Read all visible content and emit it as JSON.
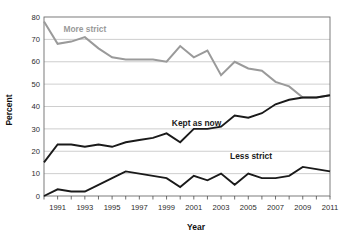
{
  "chart_data": {
    "type": "line",
    "title": "",
    "subtitle": "",
    "xlabel": "Year",
    "ylabel": "Percent",
    "xlim": [
      1990,
      2011
    ],
    "ylim": [
      0,
      80
    ],
    "grid": true,
    "legend_position": "inline-labels",
    "x_tick_labels": [
      "1991",
      "1993",
      "1995",
      "1997",
      "1999",
      "2001",
      "2003",
      "2005",
      "2007",
      "2009",
      "2011"
    ],
    "x_tick_values": [
      1991,
      1993,
      1995,
      1997,
      1999,
      2001,
      2003,
      2005,
      2007,
      2009,
      2011
    ],
    "x_minor_ticks": [
      1990,
      1991,
      1992,
      1993,
      1994,
      1995,
      1996,
      1997,
      1998,
      1999,
      2000,
      2001,
      2002,
      2003,
      2004,
      2005,
      2006,
      2007,
      2008,
      2009,
      2010,
      2011
    ],
    "y_tick_labels": [
      "0",
      "10",
      "20",
      "30",
      "40",
      "50",
      "60",
      "70",
      "80"
    ],
    "y_tick_values": [
      0,
      10,
      20,
      30,
      40,
      50,
      60,
      70,
      80
    ],
    "x": [
      1990,
      1991,
      1992,
      1993,
      1994,
      1995,
      1996,
      1997,
      1998,
      1999,
      2000,
      2001,
      2002,
      2003,
      2004,
      2005,
      2006,
      2007,
      2008,
      2009,
      2010,
      2011
    ],
    "series": [
      {
        "name": "More strict",
        "color": "#9a9a9a",
        "label_x": 1993.0,
        "label_y": 73.5,
        "values": [
          78,
          68,
          69,
          71,
          66,
          62,
          61,
          61,
          61,
          60,
          67,
          62,
          65,
          54,
          60,
          57,
          56,
          51,
          49,
          44,
          44,
          45
        ]
      },
      {
        "name": "Kept as now",
        "color": "#1a1a1a",
        "label_x": 2001.2,
        "label_y": 31.5,
        "values": [
          15,
          23,
          23,
          22,
          23,
          22,
          24,
          25,
          26,
          28,
          24,
          30,
          30,
          31,
          36,
          35,
          37,
          41,
          43,
          44,
          44,
          45
        ]
      },
      {
        "name": "Less strict",
        "color": "#1a1a1a",
        "label_x": 2005.2,
        "label_y": 16.5,
        "values": [
          0,
          3,
          2,
          2,
          5,
          8,
          11,
          10,
          9,
          8,
          4,
          9,
          7,
          10,
          5,
          10,
          8,
          8,
          9,
          13,
          12,
          11
        ]
      }
    ]
  }
}
